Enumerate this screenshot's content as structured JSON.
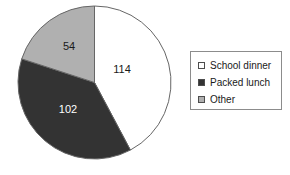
{
  "chart_data": {
    "type": "pie",
    "title": "",
    "subtitle": "",
    "xlabel": "",
    "ylabel": "",
    "total": 270,
    "start_angle_deg": 0,
    "direction": "clockwise",
    "grid": false,
    "legend_position": "right",
    "categories": [
      "School dinner",
      "Packed lunch",
      "Other"
    ],
    "values": [
      114,
      102,
      54
    ],
    "colors": [
      "#ffffff",
      "#333333",
      "#b0b0b0"
    ],
    "slices": [
      {
        "label": "School dinner",
        "value": 114,
        "value_text": "114",
        "color": "#ffffff",
        "swatch_name": "legend-swatch-school-dinner",
        "angle_deg": 152,
        "start_deg": 0,
        "end_deg": 152,
        "label_x": 105,
        "label_y": 65,
        "label_on_dark": false
      },
      {
        "label": "Packed lunch",
        "value": 102,
        "value_text": "102",
        "color": "#333333",
        "swatch_name": "legend-swatch-packed-lunch",
        "angle_deg": 136,
        "start_deg": 152,
        "end_deg": 288,
        "label_x": 51,
        "label_y": 105,
        "label_on_dark": true
      },
      {
        "label": "Other",
        "value": 54,
        "value_text": "54",
        "color": "#b0b0b0",
        "swatch_name": "legend-swatch-other",
        "angle_deg": 72,
        "start_deg": 288,
        "end_deg": 360,
        "label_x": 52,
        "label_y": 42,
        "label_on_dark": false
      }
    ],
    "geometry": {
      "center_x": 77.5,
      "center_y": 77.5,
      "radius": 76.5,
      "outline_color": "#666666"
    }
  },
  "legend": {
    "border_color": "#8c8c8c",
    "background": "#ffffff",
    "items": [
      {
        "label": "School dinner",
        "color": "#ffffff"
      },
      {
        "label": "Packed lunch",
        "color": "#333333"
      },
      {
        "label": "Other",
        "color": "#b0b0b0"
      }
    ]
  }
}
